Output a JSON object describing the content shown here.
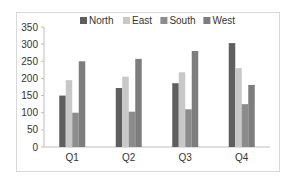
{
  "chart_data": {
    "type": "bar",
    "title": "",
    "xlabel": "",
    "ylabel": "",
    "categories": [
      "Q1",
      "Q2",
      "Q3",
      "Q4"
    ],
    "series": [
      {
        "name": "North",
        "color": "#5f5f5f",
        "values": [
          150,
          172,
          186,
          303
        ]
      },
      {
        "name": "East",
        "color": "#c8c8c8",
        "values": [
          195,
          205,
          218,
          230
        ]
      },
      {
        "name": "South",
        "color": "#8c8c8c",
        "values": [
          100,
          103,
          110,
          125
        ]
      },
      {
        "name": "West",
        "color": "#7d7d7d",
        "values": [
          250,
          257,
          280,
          181
        ]
      }
    ],
    "ylim": [
      0,
      350
    ],
    "yticks": [
      0,
      50,
      100,
      150,
      200,
      250,
      300,
      350
    ],
    "grid": false,
    "legend_position": "top"
  }
}
